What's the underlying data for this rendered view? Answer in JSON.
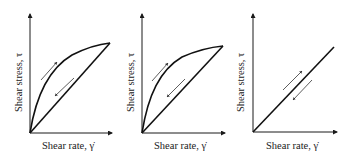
{
  "panels": [
    {
      "id": "panel-1",
      "xlabel": "Shear rate, γ̇",
      "ylabel": "Shear stress, τ",
      "behavior": "thixotropic-hysteresis-loop"
    },
    {
      "id": "panel-2",
      "xlabel": "Shear rate, γ̇",
      "ylabel": "Shear stress, τ",
      "behavior": "thixotropic-hysteresis-loop"
    },
    {
      "id": "panel-3",
      "xlabel": "Shear rate, γ̇",
      "ylabel": "Shear stress, τ",
      "behavior": "newtonian-no-hysteresis"
    }
  ],
  "colors": {
    "line": "#111111",
    "background": "#ffffff"
  }
}
